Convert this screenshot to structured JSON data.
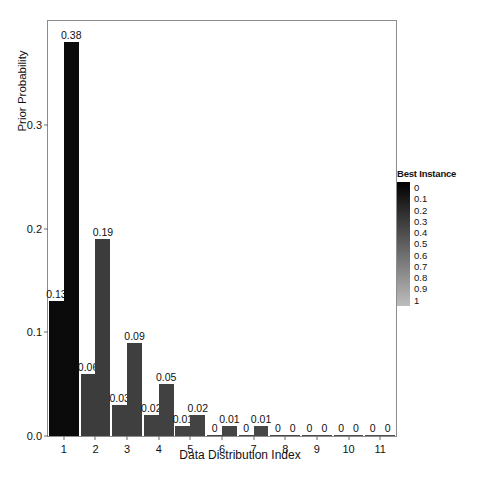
{
  "chart_data": {
    "type": "bar",
    "title": "",
    "subtitle": "",
    "xlabel": "Data Distribution Index",
    "ylabel": "Prior Probability",
    "categories": [
      "1",
      "2",
      "3",
      "4",
      "5",
      "6",
      "7",
      "8",
      "9",
      "10",
      "11"
    ],
    "x_tick_labels": [
      "1",
      "2",
      "3",
      "4",
      "5",
      "6",
      "7",
      "8",
      "9",
      "10",
      "11"
    ],
    "y_tick_labels": [
      "0.0",
      "0.1",
      "0.2",
      "0.3"
    ],
    "y_tick_values": [
      0.0,
      0.1,
      0.2,
      0.3
    ],
    "ylim": [
      0,
      0.4
    ],
    "xlim": [
      0.5,
      11.5
    ],
    "grid": false,
    "legend_position": "right",
    "series": [
      {
        "name": "lower",
        "values": [
          0.13,
          0.06,
          0.03,
          0.02,
          0.01,
          0,
          0,
          0,
          0,
          0,
          0
        ],
        "labels": [
          "0.13",
          "0.06",
          "0.03",
          "0.02",
          "0.01",
          "0",
          "0",
          "0",
          "0",
          "0",
          "0"
        ],
        "colors": [
          "#0b0b0b",
          "#3c3c3c",
          "#3f3f3f",
          "#414141",
          "#434343",
          "#454545",
          "#474747",
          "#494949",
          "#4b4b4b",
          "#4d4d4d",
          "#4f4f4f"
        ]
      },
      {
        "name": "upper",
        "values": [
          0.38,
          0.19,
          0.09,
          0.05,
          0.02,
          0.01,
          0.01,
          0,
          0,
          0,
          0
        ],
        "labels": [
          "0.38",
          "0.19",
          "0.09",
          "0.05",
          "0.02",
          "0.01",
          "0.01",
          "0",
          "0",
          "0",
          "0"
        ],
        "colors": [
          "#0b0b0b",
          "#3c3c3c",
          "#3f3f3f",
          "#414141",
          "#434343",
          "#454545",
          "#474747",
          "#494949",
          "#4b4b4b",
          "#4d4d4d",
          "#4f4f4f"
        ]
      }
    ],
    "legend": {
      "title": "Best Instance",
      "entries": [
        "0",
        "0.1",
        "0.2",
        "0.3",
        "0.4",
        "0.5",
        "0.6",
        "0.7",
        "0.8",
        "0.9",
        "1"
      ],
      "gradient_from": "#000000",
      "gradient_to": "#bdbdbd"
    },
    "colors": {
      "frame": "#8d8d8d",
      "text": "#111111",
      "background": "#ffffff",
      "bar_dark": "#0b0b0b",
      "bar_gray": "#3f3f3f"
    }
  }
}
